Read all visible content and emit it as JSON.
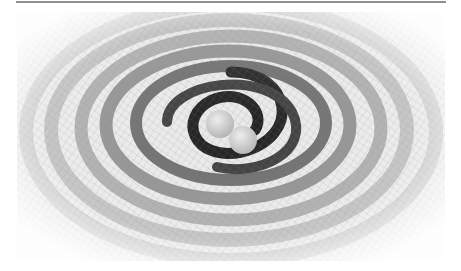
{
  "figure": {
    "description": "Grayscale illustration of two merging black holes emitting spiral gravitational-wave ripples on a mesh grid",
    "colors": {
      "background": "#ffffff",
      "rule": "#8f8f8f",
      "ripple_dark": "#1a1a1a",
      "ripple_light": "#e6e6e6",
      "black_hole_sphere": "#cfcfcf"
    }
  }
}
